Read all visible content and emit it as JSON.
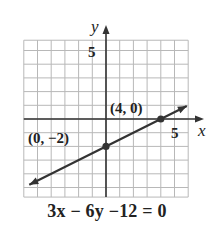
{
  "chart_data": {
    "type": "line",
    "title": "",
    "equation": "3x − 6y −12 = 0",
    "xlabel": "x",
    "ylabel": "y",
    "xlim": [
      -6,
      6
    ],
    "ylim": [
      -5.7,
      5.75
    ],
    "x_ticks_labeled": [
      5
    ],
    "y_ticks_labeled": [
      5
    ],
    "grid": true,
    "grid_step": 1,
    "series": [
      {
        "name": "3x − 6y − 12 = 0",
        "slope": 0.5,
        "intercept": -2,
        "x": [
          -5.6,
          5.9
        ],
        "y": [
          -4.8,
          0.95
        ],
        "arrows": "both"
      }
    ],
    "points": [
      {
        "x": 0,
        "y": -2,
        "label": "(0, −2)"
      },
      {
        "x": 4,
        "y": 0,
        "label": "(4, 0)"
      }
    ],
    "colors": {
      "grid": "#b8b8b8",
      "axis": "#333333",
      "line": "#333333"
    }
  },
  "labels": {
    "x_axis": "x",
    "y_axis": "y",
    "x_tick_5": "5",
    "y_tick_5": "5",
    "point_a": "(0, −2)",
    "point_b": "(4, 0)",
    "equation": "3x − 6y −12 = 0"
  }
}
